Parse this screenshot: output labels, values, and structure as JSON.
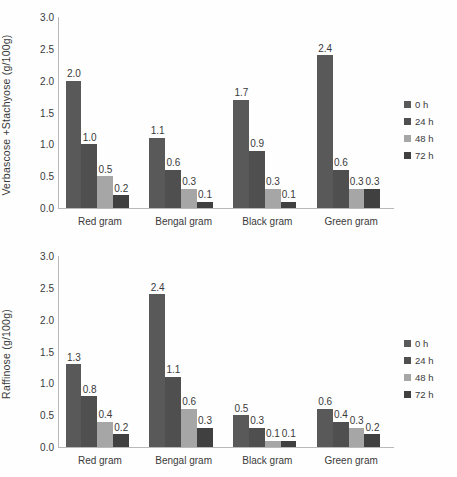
{
  "chart_data": [
    {
      "type": "bar",
      "title": "",
      "xlabel": "",
      "ylabel": "Verbascose +Stachyose  (g/100g)",
      "ylim": [
        0,
        3.0
      ],
      "yticks": [
        "3.0",
        "2.5",
        "2.0",
        "1.5",
        "1.0",
        "0.5",
        "0.0"
      ],
      "ytick_values": [
        3.0,
        2.5,
        2.0,
        1.5,
        1.0,
        0.5,
        0.0
      ],
      "grid": false,
      "legend_position": "right",
      "categories": [
        "Red gram",
        "Bengal gram",
        "Black gram",
        "Green gram"
      ],
      "series": [
        {
          "name": "0 h",
          "color": "#595959",
          "values": [
            2.0,
            1.1,
            1.7,
            2.4
          ],
          "labels": [
            "2.0",
            "1.1",
            "1.7",
            "2.4"
          ]
        },
        {
          "name": "24 h",
          "color": "#4f4f4f",
          "values": [
            1.0,
            0.6,
            0.9,
            0.6
          ],
          "labels": [
            "1.0",
            "0.6",
            "0.9",
            "0.6"
          ]
        },
        {
          "name": "48 h",
          "color": "#a6a6a6",
          "values": [
            0.5,
            0.3,
            0.3,
            0.3
          ],
          "labels": [
            "0.5",
            "0.3",
            "0.3",
            "0.3"
          ]
        },
        {
          "name": "72 h",
          "color": "#404040",
          "values": [
            0.2,
            0.1,
            0.1,
            0.3
          ],
          "labels": [
            "0.2",
            "0.1",
            "0.1",
            "0.3"
          ]
        }
      ]
    },
    {
      "type": "bar",
      "title": "",
      "xlabel": "",
      "ylabel": "Raffinose (g/100g)",
      "ylim": [
        0,
        3.0
      ],
      "yticks": [
        "3.0",
        "2.5",
        "2.0",
        "1.5",
        "1.0",
        "0.5",
        "0.0"
      ],
      "ytick_values": [
        3.0,
        2.5,
        2.0,
        1.5,
        1.0,
        0.5,
        0.0
      ],
      "grid": false,
      "legend_position": "right",
      "categories": [
        "Red gram",
        "Bengal gram",
        "Black gram",
        "Green gram"
      ],
      "series": [
        {
          "name": "0 h",
          "color": "#595959",
          "values": [
            1.3,
            2.4,
            0.5,
            0.6
          ],
          "labels": [
            "1.3",
            "2.4",
            "0.5",
            "0.6"
          ]
        },
        {
          "name": "24 h",
          "color": "#4f4f4f",
          "values": [
            0.8,
            1.1,
            0.3,
            0.4
          ],
          "labels": [
            "0.8",
            "1.1",
            "0.3",
            "0.4"
          ]
        },
        {
          "name": "48 h",
          "color": "#a6a6a6",
          "values": [
            0.4,
            0.6,
            0.1,
            0.3
          ],
          "labels": [
            "0.4",
            "0.6",
            "0.1",
            "0.3"
          ]
        },
        {
          "name": "72 h",
          "color": "#404040",
          "values": [
            0.2,
            0.3,
            0.1,
            0.2
          ],
          "labels": [
            "0.2",
            "0.3",
            "0.1",
            "0.2"
          ]
        }
      ]
    }
  ],
  "charts": {
    "top": {
      "ylabel": "Verbascose +Stachyose  (g/100g)",
      "legend": [
        {
          "label": "0 h",
          "color": "#595959"
        },
        {
          "label": "24 h",
          "color": "#4f4f4f"
        },
        {
          "label": "48 h",
          "color": "#a6a6a6"
        },
        {
          "label": "72 h",
          "color": "#404040"
        }
      ]
    },
    "bottom": {
      "ylabel": "Raffinose (g/100g)",
      "legend": [
        {
          "label": "0 h",
          "color": "#595959"
        },
        {
          "label": "24 h",
          "color": "#4f4f4f"
        },
        {
          "label": "48 h",
          "color": "#a6a6a6"
        },
        {
          "label": "72 h",
          "color": "#404040"
        }
      ]
    }
  }
}
